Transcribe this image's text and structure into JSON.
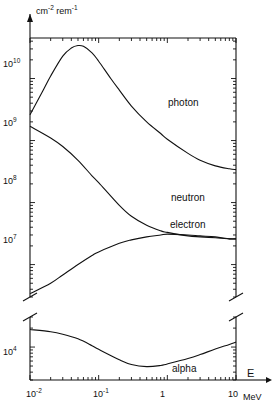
{
  "figure": {
    "unit_label": "cm",
    "unit_sup1": "-2",
    "unit_mid": " rem",
    "unit_sup2": "-1",
    "x_axis_symbol": "E",
    "x_axis_unit": "MeV"
  },
  "yticks_upper": [
    {
      "label": "10",
      "exp": "10",
      "y": 65
    },
    {
      "label": "10",
      "exp": "9",
      "y": 124
    },
    {
      "label": "10",
      "exp": "8",
      "y": 182
    },
    {
      "label": "10",
      "exp": "7",
      "y": 241
    }
  ],
  "yticks_lower": [
    {
      "label": "10",
      "exp": "4",
      "y": 353
    }
  ],
  "xticks": [
    {
      "label": "10",
      "exp": "-2",
      "x": 34
    },
    {
      "label": "10",
      "exp": "-1",
      "x": 101
    },
    {
      "label": "1",
      "exp": "",
      "x": 168
    },
    {
      "label": "10",
      "exp": "",
      "x": 236
    }
  ],
  "curve_labels": [
    {
      "name": "photon",
      "x": 168,
      "y": 97
    },
    {
      "name": "neutron",
      "x": 171,
      "y": 192
    },
    {
      "name": "electron",
      "x": 170,
      "y": 219
    },
    {
      "name": "alpha",
      "x": 172,
      "y": 363
    }
  ],
  "colors": {
    "axis": "#111111",
    "curve": "#111111",
    "background": "#ffffff"
  },
  "chart_data": {
    "type": "line",
    "title": "",
    "xlabel": "E",
    "ylabel": "cm-2 rem-1",
    "xscale": "log",
    "yscale": "log",
    "xlim": [
      0.01,
      10
    ],
    "xunit": "MeV",
    "panels": [
      {
        "name": "upper",
        "ylim": [
          3000000.0,
          45000000000.0
        ],
        "ytick_values": [
          10000000000.0,
          1000000000.0,
          100000000.0,
          10000000.0
        ],
        "series": [
          {
            "name": "photon",
            "x": [
              0.01,
              0.015,
              0.02,
              0.03,
              0.04,
              0.05,
              0.06,
              0.08,
              0.1,
              0.15,
              0.2,
              0.3,
              0.5,
              0.8,
              1.0,
              2.0,
              3.0,
              5.0,
              8.0,
              10.0
            ],
            "y": [
              2600000000.0,
              6000000000.0,
              11000000000.0,
              23000000000.0,
              31000000000.0,
              34000000000.0,
              33000000000.0,
              26000000000.0,
              19000000000.0,
              10000000000.0,
              6500000000.0,
              3600000000.0,
              2000000000.0,
              1300000000.0,
              1050000000.0,
              620000000.0,
              480000000.0,
              390000000.0,
              350000000.0,
              340000000.0
            ]
          },
          {
            "name": "neutron",
            "x": [
              0.01,
              0.02,
              0.03,
              0.05,
              0.08,
              0.1,
              0.2,
              0.3,
              0.5,
              0.8,
              1.0,
              2.0,
              3.0,
              5.0,
              8.0,
              10.0
            ],
            "y": [
              1700000000.0,
              1100000000.0,
              800000000.0,
              480000000.0,
              270000000.0,
              210000000.0,
              90000000.0,
              60000000.0,
              43000000.0,
              35000000.0,
              33000000.0,
              29000000.0,
              28000000.0,
              27000000.0,
              26000000.0,
              26000000.0
            ]
          },
          {
            "name": "electron",
            "x": [
              0.01,
              0.02,
              0.03,
              0.05,
              0.08,
              0.1,
              0.2,
              0.3,
              0.5,
              0.8,
              1.0,
              2.0,
              3.0,
              5.0,
              8.0,
              10.0
            ],
            "y": [
              3400000.0,
              5000000.0,
              6800000.0,
              10000000.0,
              14000000.0,
              16000000.0,
              22000000.0,
              25000000.0,
              28000000.0,
              30000000.0,
              31000000.0,
              30000000.0,
              29000000.0,
              28000000.0,
              26000000.0,
              26000000.0
            ]
          }
        ]
      },
      {
        "name": "lower",
        "ylim": [
          3000.0,
          30000.0
        ],
        "ytick_values": [
          10000.0
        ],
        "series": [
          {
            "name": "alpha",
            "x": [
              0.01,
              0.02,
              0.03,
              0.05,
              0.08,
              0.1,
              0.2,
              0.3,
              0.5,
              0.8,
              1.0,
              2.0,
              3.0,
              5.0,
              8.0,
              10.0
            ],
            "y": [
              19000.0,
              17500.0,
              16000.0,
              13500.0,
              10500.0,
              9200.0,
              6300.0,
              5300.0,
              4900.0,
              5100.0,
              5400.0,
              6600.0,
              7600.0,
              9300.0,
              11000.0,
              12000.0
            ]
          }
        ]
      }
    ],
    "grid": false,
    "legend": "inline-curve-labels",
    "axis_break": {
      "between_y_px": [
        297,
        317
      ]
    }
  }
}
